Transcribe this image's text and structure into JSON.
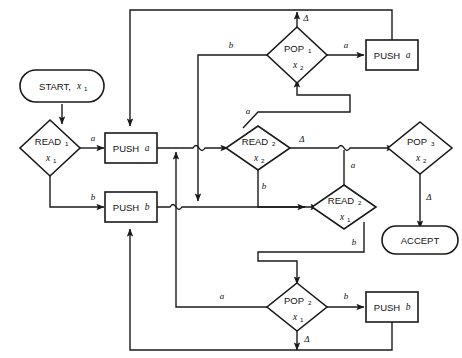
{
  "diagram": {
    "stroke_color": "#1a1a1a",
    "background_color": "#ffffff",
    "nodes": [
      {
        "id": "start",
        "type": "terminal",
        "label": "START,",
        "var": "x",
        "sub": "1",
        "cx": 62,
        "cy": 86
      },
      {
        "id": "read1",
        "type": "decision",
        "label": "READ",
        "labelsub": "1",
        "var": "x",
        "sub": "1",
        "cx": 50,
        "cy": 148
      },
      {
        "id": "pusha_l",
        "type": "process",
        "label": "PUSH",
        "var": "a",
        "cx": 130,
        "cy": 148
      },
      {
        "id": "pushb_l",
        "type": "process",
        "label": "PUSH",
        "var": "b",
        "cx": 130,
        "cy": 207
      },
      {
        "id": "pop1",
        "type": "decision",
        "label": "POP",
        "labelsub": "1",
        "var": "x",
        "sub": "2",
        "cx": 297,
        "cy": 55
      },
      {
        "id": "pusha_t",
        "type": "process",
        "label": "PUSH",
        "var": "a",
        "cx": 392,
        "cy": 55
      },
      {
        "id": "read2a",
        "type": "decision",
        "label": "READ",
        "labelsub": "2",
        "var": "x",
        "sub": "2",
        "cx": 258,
        "cy": 148
      },
      {
        "id": "read2b",
        "type": "decision",
        "label": "READ",
        "labelsub": "2",
        "var": "x",
        "sub": "1",
        "cx": 344,
        "cy": 207
      },
      {
        "id": "pop3",
        "type": "decision",
        "label": "POP",
        "labelsub": "3",
        "var": "x",
        "sub": "2",
        "cx": 420,
        "cy": 148
      },
      {
        "id": "accept",
        "type": "terminal",
        "label": "ACCEPT",
        "cx": 420,
        "cy": 240
      },
      {
        "id": "pop2",
        "type": "decision",
        "label": "POP",
        "labelsub": "2",
        "var": "x",
        "sub": "1",
        "cx": 297,
        "cy": 307
      },
      {
        "id": "pushb_b",
        "type": "process",
        "label": "PUSH",
        "var": "b",
        "cx": 392,
        "cy": 307
      }
    ],
    "edge_labels": [
      {
        "id": "read1-a",
        "text": "a",
        "x": 93,
        "y": 141
      },
      {
        "id": "read1-b",
        "text": "b",
        "x": 93,
        "y": 200
      },
      {
        "id": "pop1-b",
        "text": "b",
        "x": 231,
        "y": 48
      },
      {
        "id": "pop1-a",
        "text": "a",
        "x": 346,
        "y": 48
      },
      {
        "id": "pop1-d",
        "text": "Δ",
        "x": 306,
        "y": 18
      },
      {
        "id": "read2a-a",
        "text": "a",
        "x": 249,
        "y": 113
      },
      {
        "id": "read2a-d",
        "text": "Δ",
        "x": 302,
        "y": 141
      },
      {
        "id": "read2a-b",
        "text": "b",
        "x": 263,
        "y": 187
      },
      {
        "id": "read2b-a",
        "text": "a",
        "x": 353,
        "y": 166
      },
      {
        "id": "read2b-b",
        "text": "b",
        "x": 353,
        "y": 243
      },
      {
        "id": "pop3-d",
        "text": "Δ",
        "x": 428,
        "y": 198
      },
      {
        "id": "pop2-a",
        "text": "a",
        "x": 222,
        "y": 299
      },
      {
        "id": "pop2-b",
        "text": "b",
        "x": 346,
        "y": 299
      },
      {
        "id": "pop2-d",
        "text": "Δ",
        "x": 306,
        "y": 340
      }
    ]
  }
}
